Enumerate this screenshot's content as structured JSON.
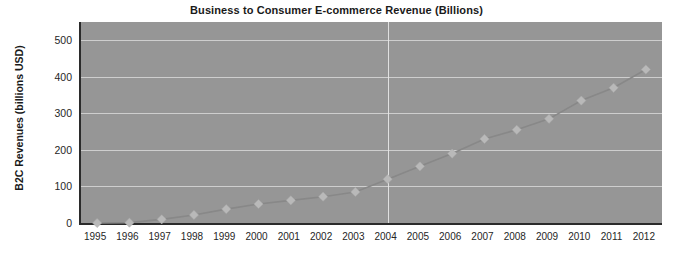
{
  "chart_data": {
    "type": "line",
    "title": "Business to Consumer E-commerce Revenue (Billions)",
    "xlabel": "",
    "ylabel": "B2C Revenues (billions USD)",
    "categories": [
      "1995",
      "1996",
      "1997",
      "1998",
      "1999",
      "2000",
      "2001",
      "2002",
      "2003",
      "2004",
      "2005",
      "2006",
      "2007",
      "2008",
      "2009",
      "2010",
      "2011",
      "2012"
    ],
    "values": [
      0,
      1,
      10,
      22,
      38,
      52,
      62,
      72,
      85,
      120,
      155,
      190,
      230,
      255,
      285,
      335,
      370,
      420
    ],
    "ylim": [
      0,
      550
    ],
    "yticks": [
      0,
      100,
      200,
      300,
      400,
      500
    ],
    "ytick_labels": [
      "0",
      "100",
      "200",
      "300",
      "400",
      "500"
    ],
    "grid": true,
    "grid_horizontal": true,
    "grid_vertical_at": "2004",
    "legend": null,
    "legend_position": "none",
    "marker": "diamond",
    "series_color": "#b9b9b9",
    "line_color": "#888888",
    "plot_background": "#969696",
    "page_background": "#ffffff",
    "axis_color": "#2b2b2b",
    "gridline_color": "#d8d8d8",
    "text_color": "#262626",
    "title_color": "#1a1a1a"
  }
}
